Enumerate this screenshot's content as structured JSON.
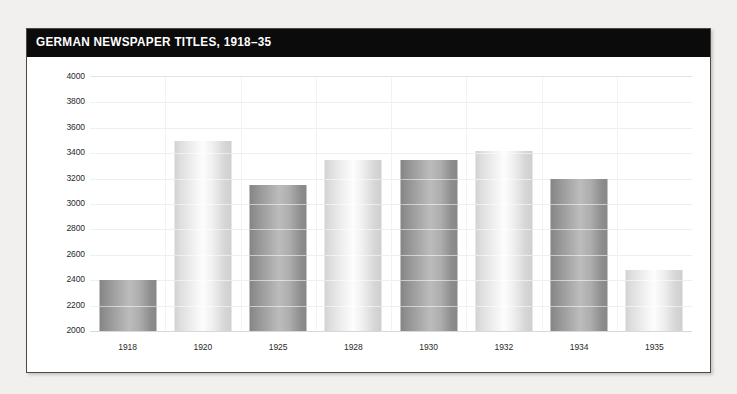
{
  "page": {
    "background_color": "#f1f0ee",
    "card_background": "#ffffff",
    "title_bar_color": "#0b0b0b"
  },
  "header": {
    "title": "GERMAN NEWSPAPER TITLES, 1918–35"
  },
  "chart_data": {
    "type": "bar",
    "title": "GERMAN NEWSPAPER TITLES, 1918–35",
    "xlabel": "",
    "ylabel": "",
    "categories": [
      "1918",
      "1920",
      "1925",
      "1928",
      "1930",
      "1932",
      "1934",
      "1935"
    ],
    "values": [
      2400,
      3500,
      3150,
      3350,
      3350,
      3420,
      3200,
      2480
    ],
    "ylim": [
      2000,
      4000
    ],
    "ytick_step": 200,
    "yticks": [
      2000,
      2200,
      2400,
      2600,
      2800,
      3000,
      3200,
      3400,
      3600,
      3800,
      4000
    ],
    "ytick_labels": [
      "2000",
      "2200",
      "2400",
      "2600",
      "2800",
      "3000",
      "3200",
      "3400",
      "3600",
      "3800",
      "4000"
    ],
    "grid": true,
    "legend": null,
    "bar_styles": [
      "dark",
      "light",
      "dark",
      "light",
      "dark",
      "light",
      "dark",
      "light"
    ],
    "colors": {
      "bar_light": "#f4f4f4",
      "bar_dark": "#a8a8a8",
      "gridline": "#efefef",
      "text": "#2a2a2a"
    }
  }
}
